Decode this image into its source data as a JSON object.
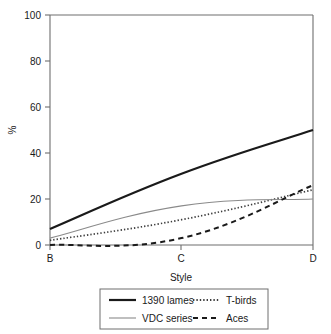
{
  "chart_data": {
    "type": "line",
    "title": "",
    "xlabel": "Style",
    "ylabel": "%",
    "categories": [
      "B",
      "C",
      "D"
    ],
    "x": [
      0,
      1,
      2
    ],
    "ylim": [
      0,
      100
    ],
    "yticks": [
      0,
      20,
      40,
      60,
      80,
      100
    ],
    "ytick_labels": [
      "0",
      "20",
      "40",
      "60",
      "80",
      "100"
    ],
    "xticks": [
      0,
      1,
      2
    ],
    "xtick_labels": [
      "B",
      "C",
      "D"
    ],
    "grid": false,
    "legend_position": "below",
    "series": [
      {
        "name": "1390 lames",
        "values": [
          7,
          31,
          50
        ],
        "style": "solid",
        "color": "#1a1a1a",
        "width": 2.2
      },
      {
        "name": "T-birds",
        "values": [
          2,
          11,
          24
        ],
        "style": "dotted",
        "color": "#3d3d3d",
        "width": 1.7
      },
      {
        "name": "VDC series",
        "values": [
          3,
          17,
          20
        ],
        "style": "solid",
        "color": "#8a8a8a",
        "width": 1.1
      },
      {
        "name": "Aces",
        "values": [
          0,
          3,
          26
        ],
        "style": "dashed",
        "color": "#1a1a1a",
        "width": 2.0
      }
    ]
  },
  "axes": {
    "y_title": "%",
    "x_title": "Style",
    "y_tick_0": "0",
    "y_tick_1": "20",
    "y_tick_2": "40",
    "y_tick_3": "60",
    "y_tick_4": "80",
    "y_tick_5": "100",
    "x_tick_0": "B",
    "x_tick_1": "C",
    "x_tick_2": "D"
  },
  "legend": {
    "entries": [
      {
        "label": "1390 lames",
        "sample": "thick-solid-black-line"
      },
      {
        "label": "T-birds",
        "sample": "dotted-line"
      },
      {
        "label": "VDC series",
        "sample": "thin-solid-gray-line"
      },
      {
        "label": "Aces",
        "sample": "dashed-line"
      }
    ]
  },
  "colors": {
    "axis": "#6e6e6e",
    "text": "#1a1a1a",
    "series_primary": "#1a1a1a",
    "series_secondary": "#8a8a8a",
    "background": "#ffffff"
  }
}
